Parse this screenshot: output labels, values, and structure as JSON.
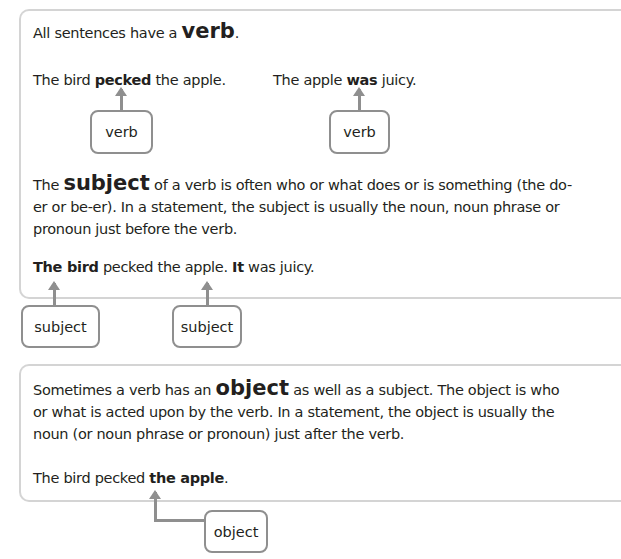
{
  "section_verb": {
    "intro_pre": "All sentences have a ",
    "intro_key": "verb",
    "intro_post": ".",
    "example1": {
      "pre": "The bird ",
      "bold": "pecked",
      "post": " the apple."
    },
    "example2": {
      "pre": "The apple ",
      "bold": "was",
      "post": " juicy."
    },
    "label1": "verb",
    "label2": "verb"
  },
  "section_subject": {
    "para_pre": "The ",
    "para_key": "subject",
    "para_post": " of a verb is often who or what does or is something (the do-er or be-er). In a statement, the subject is usually the noun, noun phrase or pronoun just before the verb.",
    "example": {
      "bold1": "The bird",
      "mid": " pecked the apple. ",
      "bold2": "It",
      "post": " was juicy."
    },
    "label1": "subject",
    "label2": "subject"
  },
  "section_object": {
    "para_pre": "Sometimes a verb has an ",
    "para_key": "object",
    "para_post": " as well as a subject. The object is who or what is acted upon by the verb. In a statement, the object is usually the noun (or noun phrase or pronoun) just after the verb.",
    "example": {
      "pre": "The bird pecked ",
      "bold": "the apple",
      "post": "."
    },
    "label": "object"
  },
  "colors": {
    "border": "#d4d4d4",
    "label_border": "#8f8f8f",
    "text": "#231f20"
  }
}
